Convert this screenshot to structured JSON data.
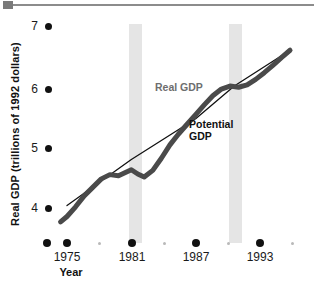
{
  "figure": {
    "top_rule": {
      "marker_name": "top-rule-square",
      "line_color": "#8c8c8c"
    }
  },
  "chart_data": {
    "type": "line",
    "title": "",
    "subtitle": "",
    "xlabel": "Year",
    "ylabel": "Real GDP (trillions of 1992 dollars)",
    "xlim": [
      1974,
      1996
    ],
    "ylim": [
      3.6,
      7.1
    ],
    "grid": false,
    "legend_position": "inline-annotations",
    "y_ticks": [
      {
        "label": "7",
        "value": 7
      },
      {
        "label": "6",
        "value": 6
      },
      {
        "label": "5",
        "value": 5
      },
      {
        "label": "4",
        "value": 4
      }
    ],
    "x_ticks_major": [
      {
        "label": "1975",
        "value": 1975
      },
      {
        "label": "1981",
        "value": 1981
      },
      {
        "label": "1987",
        "value": 1987
      },
      {
        "label": "1993",
        "value": 1993
      }
    ],
    "x_ticks_minor": [
      {
        "label": "",
        "value": 1978
      },
      {
        "label": "",
        "value": 1984
      },
      {
        "label": "",
        "value": 1990
      },
      {
        "label": "",
        "value": 1996
      }
    ],
    "annotations": [
      {
        "name": "real-gdp-label",
        "text": "Real GDP",
        "color": "#6e6e6e"
      },
      {
        "name": "potential-gdp-label",
        "text": "Potential",
        "text2": "GDP",
        "color": "#111111"
      }
    ],
    "shaded_regions": [
      {
        "name": "recession-band-1",
        "x_start": 1980.8,
        "x_end": 1982.0,
        "color": "#e5e5e5"
      },
      {
        "name": "recession-band-2",
        "x_start": 1990.1,
        "x_end": 1991.3,
        "color": "#e5e5e5"
      }
    ],
    "series": [
      {
        "name": "Real GDP",
        "color": "#4a4a4a",
        "width": 5,
        "x": [
          1974.4,
          1975.0,
          1975.8,
          1976.6,
          1977.4,
          1978.2,
          1979.0,
          1979.8,
          1980.4,
          1981.0,
          1981.6,
          1982.2,
          1983.0,
          1983.8,
          1984.6,
          1985.4,
          1986.2,
          1987.0,
          1987.8,
          1988.6,
          1989.4,
          1990.2,
          1991.0,
          1991.8,
          1992.6,
          1993.4,
          1994.2,
          1995.0,
          1995.8
        ],
        "y": [
          3.77,
          3.86,
          4.02,
          4.2,
          4.34,
          4.48,
          4.55,
          4.53,
          4.58,
          4.63,
          4.56,
          4.51,
          4.62,
          4.82,
          5.04,
          5.22,
          5.38,
          5.54,
          5.7,
          5.85,
          5.96,
          6.01,
          5.99,
          6.03,
          6.12,
          6.23,
          6.35,
          6.48,
          6.6
        ]
      },
      {
        "name": "Potential GDP",
        "color": "#111111",
        "width": 1.3,
        "x": [
          1975.0,
          1981.0,
          1987.0,
          1990.6,
          1995.8
        ],
        "y": [
          4.04,
          4.8,
          5.47,
          6.01,
          6.6
        ]
      }
    ]
  },
  "axes": {
    "y_title": "Real GDP (trillions of 1992 dollars)",
    "x_title": "Year",
    "y_tick_labels": [
      "7",
      "6",
      "5",
      "4"
    ],
    "x_tick_labels": [
      "1975",
      "1981",
      "1987",
      "1993"
    ]
  },
  "labels": {
    "real_gdp": "Real GDP",
    "potential_gdp_line1": "Potential",
    "potential_gdp_line2": "GDP"
  }
}
